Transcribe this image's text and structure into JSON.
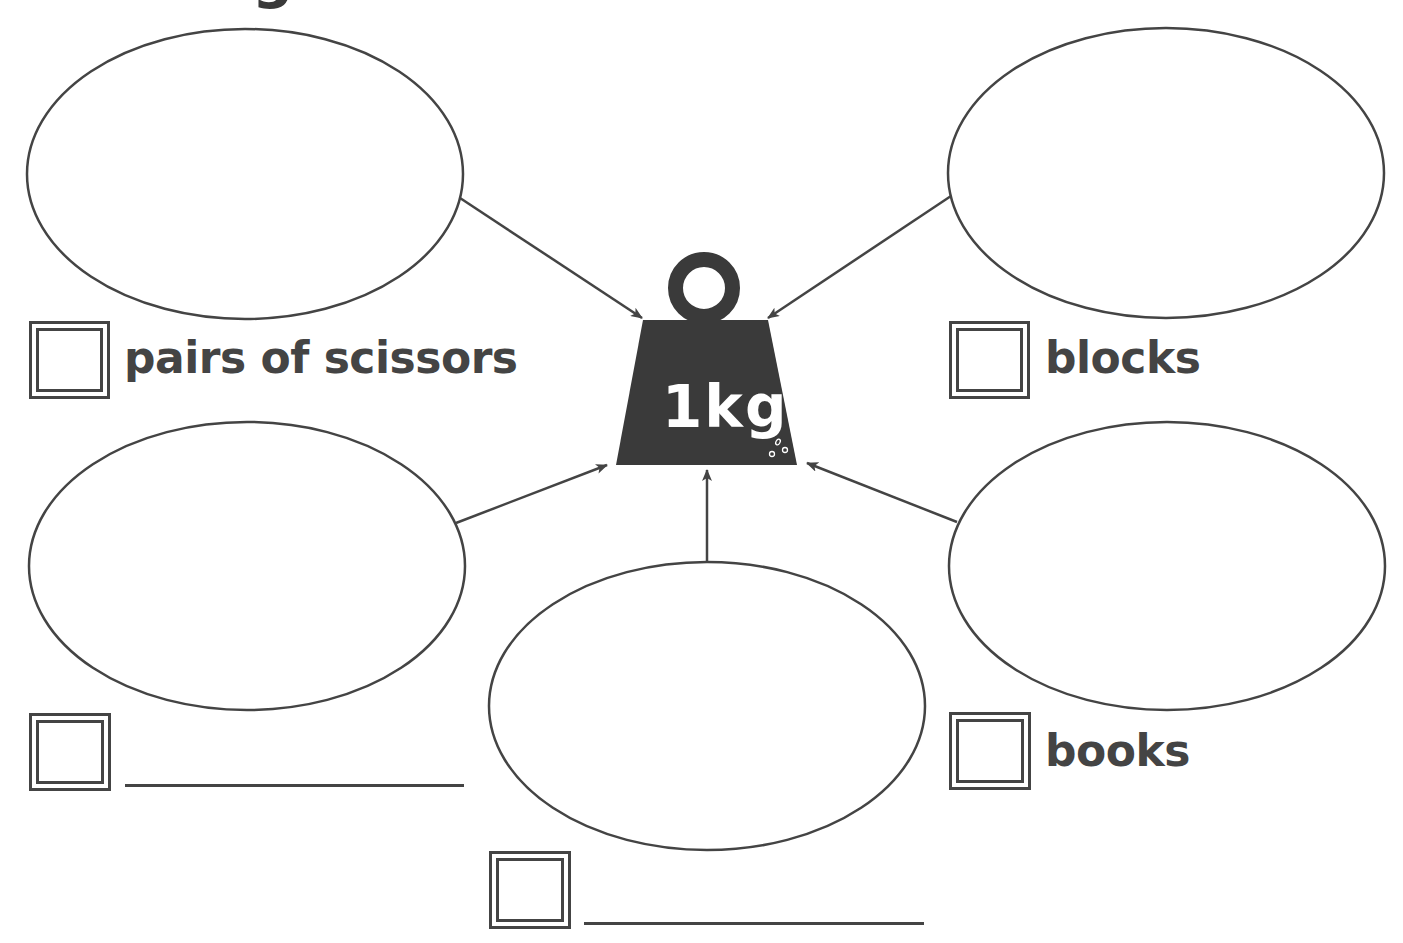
{
  "header": {
    "cut_off_title_fragment": "g"
  },
  "center_weight": {
    "label": "1kg",
    "icon": "weight-icon",
    "fill_color": "#3a3a3a"
  },
  "items": [
    {
      "position": "top-left",
      "label": "pairs of scissors",
      "checkbox_value": "",
      "has_blank_line": false
    },
    {
      "position": "top-right",
      "label": "blocks",
      "checkbox_value": "",
      "has_blank_line": false
    },
    {
      "position": "middle-left",
      "label": "",
      "checkbox_value": "",
      "has_blank_line": true
    },
    {
      "position": "middle-right",
      "label": "books",
      "checkbox_value": "",
      "has_blank_line": false
    },
    {
      "position": "bottom-center",
      "label": "",
      "checkbox_value": "",
      "has_blank_line": true
    }
  ],
  "colors": {
    "line": "#444444",
    "background": "#ffffff"
  }
}
